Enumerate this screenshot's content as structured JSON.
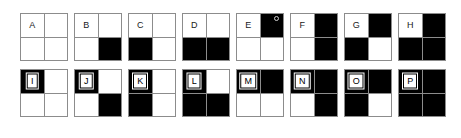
{
  "figure": {
    "colors": {
      "background": "#ffffff",
      "filled": "#000000",
      "empty": "#ffffff",
      "grid_line": "#8c8c8c",
      "label_text": "#1a1a1a"
    },
    "quadrant_order": [
      "top-left",
      "top-right",
      "bottom-left",
      "bottom-right"
    ],
    "rows": [
      {
        "row_index": 0,
        "tiles": [
          {
            "label": "A",
            "quadrants": [
              0,
              0,
              0,
              0
            ],
            "speck": false
          },
          {
            "label": "B",
            "quadrants": [
              0,
              0,
              0,
              1
            ],
            "speck": false
          },
          {
            "label": "C",
            "quadrants": [
              0,
              0,
              1,
              0
            ],
            "speck": false
          },
          {
            "label": "D",
            "quadrants": [
              0,
              0,
              1,
              1
            ],
            "speck": false
          },
          {
            "label": "E",
            "quadrants": [
              0,
              1,
              0,
              0
            ],
            "speck": true
          },
          {
            "label": "F",
            "quadrants": [
              0,
              1,
              0,
              1
            ],
            "speck": false
          },
          {
            "label": "G",
            "quadrants": [
              0,
              1,
              1,
              0
            ],
            "speck": false
          },
          {
            "label": "H",
            "quadrants": [
              0,
              1,
              1,
              1
            ],
            "speck": false
          }
        ]
      },
      {
        "row_index": 1,
        "tiles": [
          {
            "label": "I",
            "quadrants": [
              1,
              0,
              0,
              0
            ],
            "speck": false
          },
          {
            "label": "J",
            "quadrants": [
              1,
              0,
              0,
              1
            ],
            "speck": false
          },
          {
            "label": "K",
            "quadrants": [
              1,
              0,
              1,
              0
            ],
            "speck": false
          },
          {
            "label": "L",
            "quadrants": [
              1,
              0,
              1,
              1
            ],
            "speck": false
          },
          {
            "label": "M",
            "quadrants": [
              1,
              1,
              0,
              0
            ],
            "speck": false
          },
          {
            "label": "N",
            "quadrants": [
              1,
              1,
              0,
              1
            ],
            "speck": false
          },
          {
            "label": "O",
            "quadrants": [
              1,
              1,
              1,
              0
            ],
            "speck": false
          },
          {
            "label": "P",
            "quadrants": [
              1,
              1,
              1,
              1
            ],
            "speck": false
          }
        ]
      }
    ]
  }
}
